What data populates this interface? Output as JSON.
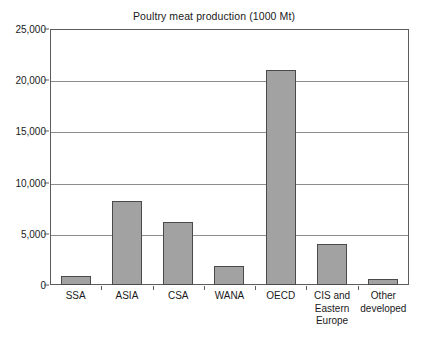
{
  "chart_data": {
    "type": "bar",
    "title": "Poultry meat production (1000 Mt)",
    "xlabel": "",
    "ylabel": "",
    "ylim": [
      0,
      25000
    ],
    "yticks": [
      0,
      5000,
      10000,
      15000,
      20000,
      25000
    ],
    "ytick_labels": [
      "0",
      "5,000",
      "10,000",
      "15,000",
      "20,000",
      "25,000"
    ],
    "grid": true,
    "legend": false,
    "categories": [
      "SSA",
      "ASIA",
      "CSA",
      "WANA",
      "OECD",
      "CIS and Eastern Europe",
      "Other developed"
    ],
    "category_lines": [
      [
        "SSA"
      ],
      [
        "ASIA"
      ],
      [
        "CSA"
      ],
      [
        "WANA"
      ],
      [
        "OECD"
      ],
      [
        "CIS and",
        "Eastern",
        "Europe"
      ],
      [
        "Other",
        "developed"
      ]
    ],
    "values": [
      900,
      8200,
      6200,
      1900,
      21000,
      4000,
      600
    ],
    "bar_color": "#a2a2a2",
    "bar_edge_color": "#4a4a4a",
    "grid_color": "#8d8d8d",
    "axis_color": "#5c5c5c",
    "text_color": "#1a1a1a"
  }
}
